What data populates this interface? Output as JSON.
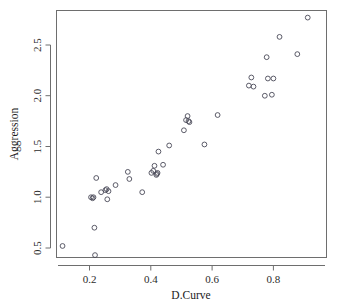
{
  "chart_data": {
    "type": "scatter",
    "title": "",
    "xlabel": "D.Curve",
    "ylabel": "Aggression",
    "xlim": [
      0.085,
      0.945
    ],
    "ylim": [
      0.36,
      2.84
    ],
    "grid": false,
    "legend": null,
    "xticks": [
      0.2,
      0.4,
      0.6,
      0.8
    ],
    "xtick_labels": [
      "0.2",
      "0.4",
      "0.6",
      "0.8"
    ],
    "yticks": [
      0.5,
      1.0,
      1.5,
      2.0,
      2.5
    ],
    "ytick_labels": [
      "0.5",
      "1.0",
      "1.5",
      "2.0",
      "2.5"
    ],
    "marker": "open-circle",
    "marker_color": "#4a4a58",
    "point_count": 41,
    "x": [
      0.112,
      0.205,
      0.21,
      0.213,
      0.216,
      0.218,
      0.222,
      0.238,
      0.252,
      0.256,
      0.258,
      0.262,
      0.285,
      0.325,
      0.33,
      0.372,
      0.402,
      0.408,
      0.412,
      0.418,
      0.42,
      0.422,
      0.425,
      0.44,
      0.46,
      0.508,
      0.515,
      0.52,
      0.523,
      0.526,
      0.575,
      0.618,
      0.72,
      0.728,
      0.735,
      0.772,
      0.778,
      0.782,
      0.795,
      0.8,
      0.82,
      0.878,
      0.912
    ],
    "y": [
      0.52,
      1.0,
      0.99,
      1.0,
      0.7,
      0.43,
      1.19,
      1.05,
      1.07,
      1.08,
      0.98,
      1.06,
      1.12,
      1.25,
      1.18,
      1.05,
      1.24,
      1.26,
      1.31,
      1.22,
      1.23,
      1.24,
      1.45,
      1.32,
      1.51,
      1.66,
      1.76,
      1.8,
      1.75,
      1.74,
      1.52,
      1.81,
      2.1,
      2.18,
      2.09,
      2.0,
      2.38,
      2.17,
      2.01,
      2.17,
      2.58,
      2.41,
      2.77
    ]
  },
  "plot": {
    "frame": {
      "left": 56,
      "top": 10,
      "right": 327,
      "bottom": 258
    },
    "axis_title_x_label": "D.Curve",
    "axis_title_y_label": "Aggression"
  }
}
